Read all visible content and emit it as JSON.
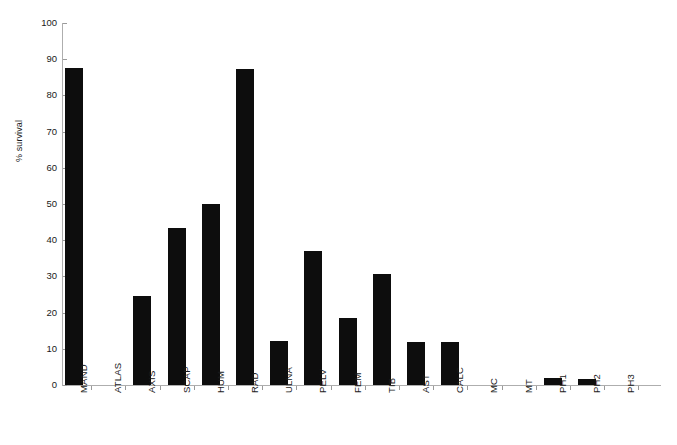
{
  "chart": {
    "title": "",
    "ylabel": "% survival"
  },
  "chart_data": {
    "type": "bar",
    "title": "",
    "xlabel": "",
    "ylabel": "% survival",
    "ylim": [
      0,
      100
    ],
    "yticks": [
      0,
      10,
      20,
      30,
      40,
      50,
      60,
      70,
      80,
      90,
      100
    ],
    "grid": false,
    "legend": null,
    "bar_color": "#0d0d0d",
    "categories": [
      "MAND",
      "ATLAS",
      "AXIS",
      "SCAP",
      "HUM",
      "RAD",
      "ULNA",
      "PELV",
      "FEM",
      "TIB",
      "AST",
      "CALC",
      "MC",
      "MT",
      "PH1",
      "PH2",
      "PH3"
    ],
    "values": [
      87.5,
      0,
      24.7,
      43.4,
      50,
      87.3,
      12.2,
      37,
      18.4,
      30.8,
      12,
      12,
      0,
      0,
      1.8,
      1.6,
      0
    ]
  }
}
